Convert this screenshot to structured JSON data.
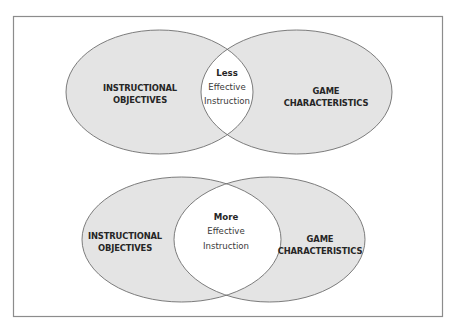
{
  "colors": {
    "frame": "#8c8c8c",
    "circle_fill": "#e4e4e4",
    "circle_stroke": "#6e6e6e",
    "overlap_fill": "#ffffff",
    "text": "#262626"
  },
  "diagrams": [
    {
      "id": "less-overlap",
      "left_circle": {
        "line1": "INSTRUCTIONAL",
        "line2": "OBJECTIVES"
      },
      "right_circle": {
        "line1": "GAME",
        "line2": "CHARACTERISTICS"
      },
      "overlap": {
        "line1": "Less",
        "line2": "Effective",
        "line3": "Instruction"
      }
    },
    {
      "id": "more-overlap",
      "left_circle": {
        "line1": "INSTRUCTIONAL",
        "line2": "OBJECTIVES"
      },
      "right_circle": {
        "line1": "GAME",
        "line2": "CHARACTERISTICS"
      },
      "overlap": {
        "line1": "More",
        "line2": "Effective",
        "line3": "Instruction"
      }
    }
  ]
}
